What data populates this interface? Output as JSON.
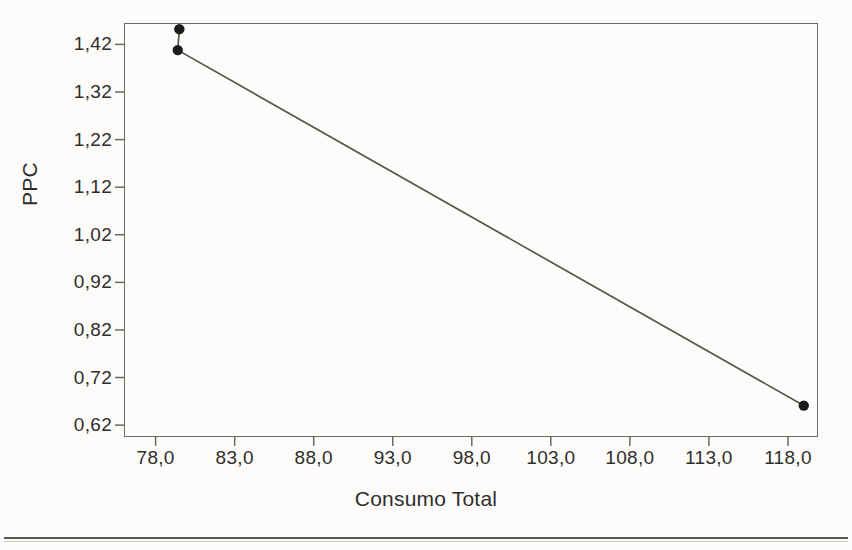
{
  "chart_data": {
    "type": "line",
    "title": "",
    "subtitle": "",
    "xlabel": "Consumo Total",
    "ylabel": "PPC",
    "xlim": [
      76.0,
      119.9
    ],
    "ylim": [
      0.595,
      1.465
    ],
    "grid": false,
    "legend": null,
    "marker": "filled-circle",
    "line_color": "#55554f",
    "marker_color": "#1c1c1a",
    "x_ticks": [
      78.0,
      83.0,
      88.0,
      93.0,
      98.0,
      103.0,
      108.0,
      113.0,
      118.0
    ],
    "x_tick_labels": [
      "78,0",
      "83,0",
      "88,0",
      "93,0",
      "98,0",
      "103,0",
      "108,0",
      "113,0",
      "118,0"
    ],
    "y_ticks": [
      0.62,
      0.72,
      0.82,
      0.92,
      1.02,
      1.12,
      1.22,
      1.32,
      1.42
    ],
    "y_tick_labels": [
      "0,62",
      "0,72",
      "0,82",
      "0,92",
      "1,02",
      "1,12",
      "1,22",
      "1,32",
      "1,42"
    ],
    "series": [
      {
        "name": "PPC",
        "points": [
          {
            "x": 79.5,
            "y": 1.452
          },
          {
            "x": 79.4,
            "y": 1.408
          },
          {
            "x": 119.0,
            "y": 0.661
          }
        ]
      }
    ]
  },
  "axes": {
    "x_title": "Consumo Total",
    "y_title": "PPC"
  }
}
